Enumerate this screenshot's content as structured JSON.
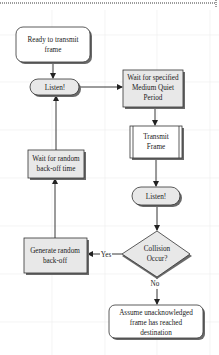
{
  "diagram": {
    "type": "flowchart",
    "colors": {
      "background": "#ffffff",
      "grid": "#e6e6e6",
      "border_dotted": "#3a3a3a",
      "node_fill_terminal": "#ffffff",
      "node_fill_process": "#e8e8e8",
      "node_stroke": "#333333",
      "shadow": "#6a6a6a",
      "edge": "#222222"
    },
    "nodes": {
      "ready": {
        "shape": "rounded-rect",
        "lines": [
          "Ready to transmit",
          "frame"
        ]
      },
      "listen1": {
        "shape": "pill",
        "lines": [
          "Listen!"
        ]
      },
      "wait_quiet": {
        "shape": "rect",
        "lines": [
          "Wait for specified",
          "Medium Quiet",
          "Period"
        ]
      },
      "transmit": {
        "shape": "predefined-process",
        "lines": [
          "Transmit",
          "Frame"
        ]
      },
      "listen2": {
        "shape": "pill",
        "lines": [
          "Listen!"
        ]
      },
      "collision": {
        "shape": "diamond",
        "lines": [
          "Collision",
          "Occur?"
        ]
      },
      "generate_backoff": {
        "shape": "rect",
        "lines": [
          "Generate random",
          "back-off"
        ]
      },
      "wait_backoff": {
        "shape": "rect",
        "lines": [
          "Wait for random",
          "back-off time"
        ]
      },
      "assume_delivered": {
        "shape": "rounded-rect",
        "lines": [
          "Assume unacknowledged",
          "frame has reached",
          "destination"
        ]
      }
    },
    "edges": [
      {
        "from": "ready",
        "to": "listen1",
        "label": ""
      },
      {
        "from": "listen1",
        "to": "wait_quiet",
        "label": ""
      },
      {
        "from": "wait_quiet",
        "to": "transmit",
        "label": ""
      },
      {
        "from": "transmit",
        "to": "listen2",
        "label": ""
      },
      {
        "from": "listen2",
        "to": "collision",
        "label": ""
      },
      {
        "from": "collision",
        "to": "generate_backoff",
        "label": "Yes"
      },
      {
        "from": "collision",
        "to": "assume_delivered",
        "label": "No"
      },
      {
        "from": "generate_backoff",
        "to": "wait_backoff",
        "label": ""
      },
      {
        "from": "wait_backoff",
        "to": "listen1",
        "label": ""
      }
    ],
    "labels": {
      "yes": "Yes",
      "no": "No"
    }
  }
}
